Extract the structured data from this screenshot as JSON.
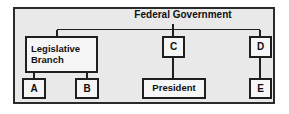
{
  "diagram": {
    "title": "Federal Government",
    "frame_color": "#2b2b2b",
    "panel_bg": "#e9e9e9",
    "box_bg": "#f6f6f6",
    "line_color": "#1f1f1f",
    "nodes": {
      "root": {
        "label": "Federal Government"
      },
      "legislative": {
        "line1": "Legislative",
        "line2": "Branch"
      },
      "a": {
        "label": "A"
      },
      "b": {
        "label": "B"
      },
      "c": {
        "label": "C"
      },
      "president": {
        "label": "President"
      },
      "d": {
        "label": "D"
      },
      "e": {
        "label": "E"
      }
    }
  }
}
